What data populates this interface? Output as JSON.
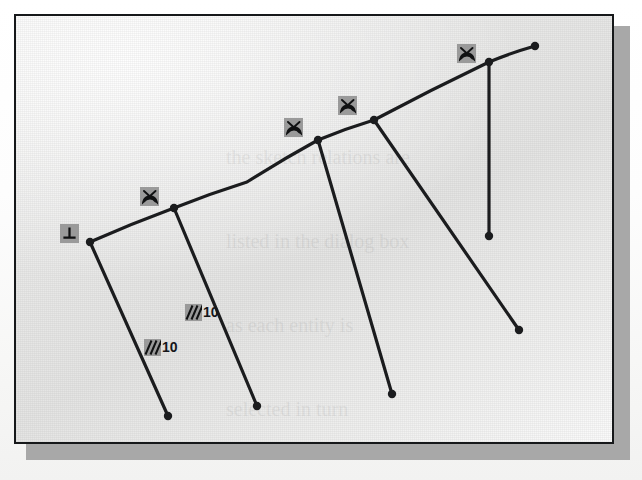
{
  "figure": {
    "kind": "cad-sketch",
    "title": "",
    "plate": {
      "border_color": "#16181a",
      "background_color": "#ebebea",
      "shadow_color": "#a8a8a8",
      "x": 14,
      "y": 14,
      "width": 600,
      "height": 430
    },
    "geometry": {
      "line_color": "#1b1c1e",
      "line_width": 3.2,
      "node_color": "#1b1c1e",
      "node_radius": 4.2,
      "spine": {
        "name": "tangent-arc-spine",
        "points": [
          [
            74,
            226
          ],
          [
            158,
            192
          ],
          [
            231,
            166
          ],
          [
            302,
            124
          ],
          [
            358,
            104
          ],
          [
            473,
            46
          ],
          [
            519,
            30
          ]
        ],
        "vertices": [
          {
            "name": "spine-vertex-1",
            "x": 74,
            "y": 226
          },
          {
            "name": "spine-vertex-2",
            "x": 158,
            "y": 192
          },
          {
            "name": "spine-vertex-3",
            "x": 302,
            "y": 124
          },
          {
            "name": "spine-vertex-4",
            "x": 358,
            "y": 104
          },
          {
            "name": "spine-vertex-5",
            "x": 473,
            "y": 46
          },
          {
            "name": "spine-endpoint",
            "x": 519,
            "y": 30
          }
        ]
      },
      "ribs": [
        {
          "name": "rib-1",
          "from": [
            74,
            226
          ],
          "to": [
            152,
            400
          ],
          "length_label": "10"
        },
        {
          "name": "rib-2",
          "from": [
            158,
            192
          ],
          "to": [
            241,
            390
          ],
          "length_label": "10"
        },
        {
          "name": "rib-3",
          "from": [
            302,
            124
          ],
          "to": [
            376,
            378
          ],
          "length_label": ""
        },
        {
          "name": "rib-4",
          "from": [
            358,
            104
          ],
          "to": [
            503,
            314
          ],
          "length_label": ""
        },
        {
          "name": "rib-5",
          "from": [
            473,
            46
          ],
          "to": [
            473,
            220
          ],
          "length_label": ""
        }
      ]
    },
    "markers": [
      {
        "name": "perpendicular-constraint-marker",
        "icon": "perpendicular-icon",
        "glyph": "⊥",
        "x": 44,
        "y": 208,
        "size": 19,
        "box_color": "#9a9a9a",
        "glyph_color": "#101112"
      },
      {
        "name": "tangent-constraint-marker-1",
        "icon": "tangent-icon",
        "glyph": "tangent",
        "x": 124,
        "y": 171,
        "size": 19,
        "box_color": "#9a9a9a",
        "glyph_color": "#101112"
      },
      {
        "name": "tangent-constraint-marker-2",
        "icon": "tangent-icon",
        "glyph": "tangent",
        "x": 268,
        "y": 102,
        "size": 19,
        "box_color": "#9a9a9a",
        "glyph_color": "#101112"
      },
      {
        "name": "tangent-constraint-marker-3",
        "icon": "tangent-icon",
        "glyph": "tangent",
        "x": 322,
        "y": 80,
        "size": 19,
        "box_color": "#9a9a9a",
        "glyph_color": "#101112"
      },
      {
        "name": "tangent-constraint-marker-4",
        "icon": "tangent-icon",
        "glyph": "tangent",
        "x": 441,
        "y": 28,
        "size": 19,
        "box_color": "#9a9a9a",
        "glyph_color": "#101112"
      }
    ],
    "dimensions": [
      {
        "name": "equal-length-dimension-1",
        "icon": "equal-length-icon",
        "value": "10",
        "x": 169,
        "y": 288,
        "box_color": "#9a9a9a",
        "text_color": "#15161a"
      },
      {
        "name": "equal-length-dimension-2",
        "icon": "equal-length-icon",
        "value": "10",
        "x": 128,
        "y": 323,
        "box_color": "#9a9a9a",
        "text_color": "#15161a"
      }
    ]
  },
  "page": {
    "ghost_text_outer": "D  Click OK to apply the changes\n\nthe profile appears with the\n\nrelations displayed beside each\n\nsegment of the sketch geometry.\n\n10  Click OK to close the dialog box.",
    "ghost_text_inner": "the sketch relations are\n\nlisted in the dialog box\n\nas each entity is\n\nselected in turn"
  }
}
